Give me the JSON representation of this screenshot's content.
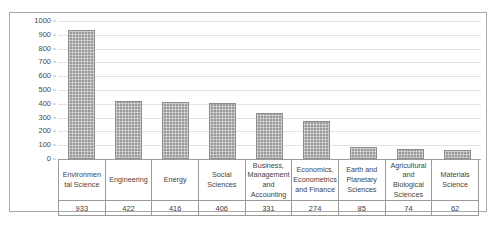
{
  "chart_data": {
    "type": "bar",
    "title": "",
    "subtitle": "",
    "xlabel": "",
    "ylabel": "",
    "ylim": [
      0,
      1000
    ],
    "ytick_step": 100,
    "yticks": [
      "1000",
      "900",
      "800",
      "700",
      "600",
      "500",
      "400",
      "300",
      "200",
      "100",
      "0"
    ],
    "grid": true,
    "legend": "none",
    "bar_color": "#9a9a9a",
    "gridline_color": "#e3e3e3",
    "frame_color": "#a9a9a9",
    "categories": [
      "Environmen tal Science",
      "Engineering",
      "Energy",
      "Social Sciences",
      "Business, Management and Accounting",
      "Economics, Econometrics and Finance",
      "Earth and Planetary Sciences",
      "Agricultural and Biological Sciences",
      "Materials Science"
    ],
    "values": [
      933,
      422,
      416,
      406,
      331,
      274,
      85,
      74,
      62
    ],
    "value_labels": [
      "933",
      "422",
      "416",
      "406",
      "331",
      "274",
      "85",
      "74",
      "62"
    ]
  },
  "table": {
    "label_row": [
      "Environmen tal Science",
      "Engineering",
      "Energy",
      "Social Sciences",
      "Business, Management and Accounting",
      "Economics, Econometrics and Finance",
      "Earth and Planetary Sciences",
      "Agricultural and Biological Sciences",
      "Materials Science"
    ],
    "value_row": [
      "933",
      "422",
      "416",
      "406",
      "331",
      "274",
      "85",
      "74",
      "62"
    ]
  },
  "watermark": {
    "left": "",
    "mid": "",
    "small": ""
  }
}
